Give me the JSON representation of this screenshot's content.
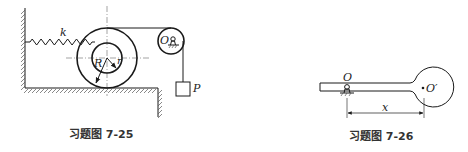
{
  "figures": [
    {
      "caption": "习题图 7-25",
      "labels": {
        "spring": "k",
        "outer_radius": "R",
        "inner_radius": "r",
        "pulley_center": "O",
        "weight": "P"
      }
    },
    {
      "caption": "习题图 7-26",
      "labels": {
        "pivot": "O",
        "ball_center": "O′",
        "distance": "x"
      }
    }
  ],
  "colors": {
    "stroke": "#1a1a1a",
    "background": "#ffffff"
  }
}
